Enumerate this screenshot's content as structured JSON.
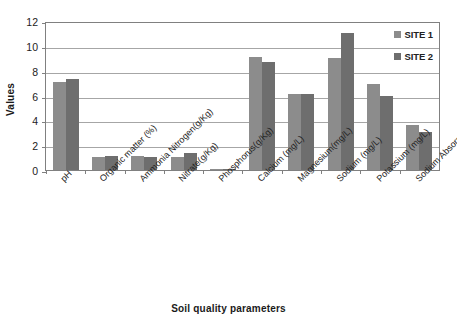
{
  "chart_data": {
    "type": "bar",
    "title": "",
    "xlabel": "Soil quality parameters",
    "ylabel": "Values",
    "ylim": [
      0,
      12
    ],
    "yticks": [
      0,
      2,
      4,
      6,
      8,
      10,
      12
    ],
    "grid": true,
    "legend_position": "top-right",
    "categories": [
      "pH",
      "Organic matter (%)",
      "Ammonia Nitrogen(g/Kg)",
      "Nitrate(g/Kg)",
      "Phosphorus(g/Kg)",
      "Calcium (mg/L)",
      "Magnesium(mg/L)",
      "Sodium (mg/L)",
      "Potassium (mg/L)",
      "Sodium Absorption Ratio (SAR)"
    ],
    "series": [
      {
        "name": "SITE 1",
        "color": "#8c8c8c",
        "values": [
          7.1,
          1.05,
          1.1,
          1.05,
          0.05,
          9.1,
          6.1,
          9.0,
          6.95,
          3.6
        ]
      },
      {
        "name": "SITE 2",
        "color": "#6e6e6e",
        "values": [
          7.3,
          1.1,
          1.05,
          1.4,
          0.07,
          8.7,
          6.1,
          11.0,
          5.95,
          3.05
        ]
      }
    ]
  }
}
